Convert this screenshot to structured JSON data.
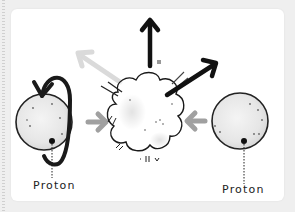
{
  "diagram": {
    "type": "proton-proton collision illustration",
    "labels": {
      "left_particle": "Proton",
      "right_particle": "Proton"
    },
    "elements": [
      {
        "name": "left-proton",
        "shape": "circle",
        "annotation": "spin arrow"
      },
      {
        "name": "right-proton",
        "shape": "circle"
      },
      {
        "name": "collision-burst",
        "shape": "cloud"
      },
      {
        "name": "incoming-arrow-left",
        "direction": "right"
      },
      {
        "name": "incoming-arrow-right",
        "direction": "left"
      },
      {
        "name": "outgoing-arrow-up",
        "direction": "up"
      },
      {
        "name": "outgoing-arrow-upper-right",
        "direction": "up-right"
      },
      {
        "name": "outgoing-arrow-upper-left",
        "direction": "up-left",
        "faded": true
      }
    ],
    "colors": {
      "ink": "#1a1a1a",
      "incoming_arrow": "#a0a0a0",
      "faded_arrow": "#d8d8d8",
      "card": "#ffffff",
      "background": "#efefef"
    }
  }
}
